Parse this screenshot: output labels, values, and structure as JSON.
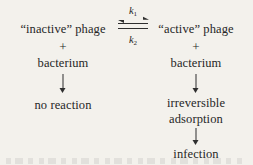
{
  "diagram": {
    "background_color": "#f3f1ec",
    "ink_color": "#2b2b2b",
    "left_branch": {
      "species": "“inactive” phage",
      "plus": "+",
      "partner": "bacterium",
      "outcome": "no reaction"
    },
    "right_branch": {
      "species": "“active” phage",
      "plus": "+",
      "partner": "bacterium",
      "outcome_line1": "irreversible",
      "outcome_line2": "adsorption",
      "final_outcome": "infection"
    },
    "equilibrium": {
      "forward_rate": "k",
      "forward_rate_sub": "1",
      "reverse_rate": "k",
      "reverse_rate_sub": "2",
      "symbol": "reversible-double-harpoon"
    }
  }
}
